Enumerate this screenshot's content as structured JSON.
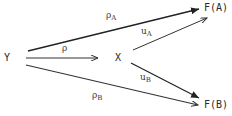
{
  "diagram": {
    "nodes": {
      "Y": "Y",
      "X": "X",
      "FA": "F(A)",
      "FB": "F(B)"
    },
    "arrows": {
      "rho": {
        "label": "ρ",
        "from": "Y",
        "to": "X"
      },
      "rhoA": {
        "label": "ρ",
        "sub": "A",
        "from": "Y",
        "to": "F(A)"
      },
      "rhoB": {
        "label": "ρ",
        "sub": "B",
        "from": "Y",
        "to": "F(B)"
      },
      "uA": {
        "label": "u",
        "sub": "A",
        "from": "X",
        "to": "F(A)"
      },
      "uB": {
        "label": "u",
        "sub": "B",
        "from": "X",
        "to": "F(B)"
      }
    },
    "colors": {
      "line": "#333333",
      "text": "#2a2a2a"
    }
  }
}
